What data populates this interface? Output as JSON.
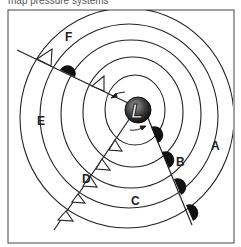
{
  "caption": "map pressure systems",
  "low": {
    "symbol": "L",
    "label": "low-pressure center"
  },
  "region_labels": [
    {
      "id": "A",
      "x": 214,
      "y": 150
    },
    {
      "id": "B",
      "x": 180,
      "y": 162
    },
    {
      "id": "C",
      "x": 137,
      "y": 202
    },
    {
      "id": "D",
      "x": 86,
      "y": 180
    },
    {
      "id": "E",
      "x": 41,
      "y": 126
    },
    {
      "id": "F",
      "x": 69,
      "y": 41
    }
  ],
  "fronts": {
    "occluded": "occluded front",
    "cold": "cold front",
    "warm": "warm front"
  },
  "colors": {
    "line": "#222222",
    "frame": "#444444",
    "low_fill": "#333333"
  }
}
